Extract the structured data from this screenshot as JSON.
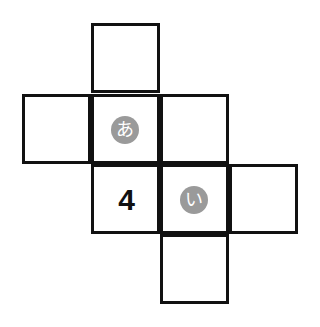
{
  "diagram": {
    "title": "",
    "cells": [
      {
        "id": "top",
        "label": ""
      },
      {
        "id": "left",
        "label": ""
      },
      {
        "id": "center",
        "label": "あ",
        "style": "circle"
      },
      {
        "id": "center-right",
        "label": ""
      },
      {
        "id": "lower-left",
        "label": "4",
        "style": "number"
      },
      {
        "id": "lower-center",
        "label": "い",
        "style": "circle"
      },
      {
        "id": "lower-right",
        "label": ""
      },
      {
        "id": "bottom",
        "label": ""
      }
    ],
    "colors": {
      "line": "#111111",
      "circle_fill": "#9a9a9a",
      "circle_text": "#ffffff"
    }
  }
}
